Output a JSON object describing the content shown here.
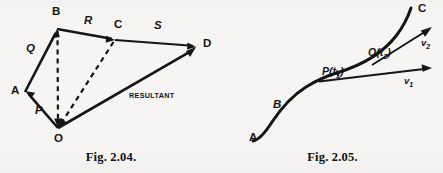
{
  "page": {
    "background_color": "#f6f5f3",
    "ink_color": "#151515",
    "width": 443,
    "height": 173
  },
  "figures": [
    {
      "id": "fig-2-04",
      "caption": "Fig. 2.04.",
      "caption_x": 110,
      "caption_y": 152,
      "description": "Vector polygon addition: vectors P, Q, R, S chained from O to D with resultant O to D",
      "vertices": [
        {
          "label": "O",
          "x": 58,
          "y": 128,
          "label_x": 54,
          "label_y": 136
        },
        {
          "label": "A",
          "x": 25,
          "y": 92,
          "label_x": 11,
          "label_y": 88
        },
        {
          "label": "B",
          "x": 57,
          "y": 29,
          "label_x": 52,
          "label_y": 9
        },
        {
          "label": "C",
          "x": 115,
          "y": 40,
          "label_x": 115,
          "label_y": 22
        },
        {
          "label": "D",
          "x": 196,
          "y": 47,
          "label_x": 203,
          "label_y": 42
        }
      ],
      "vector_labels": [
        {
          "text": "Q",
          "x": 27,
          "y": 47
        },
        {
          "text": "P",
          "x": 36,
          "y": 110
        },
        {
          "text": "R",
          "x": 85,
          "y": 19
        },
        {
          "text": "S",
          "x": 155,
          "y": 24
        }
      ],
      "annotation": {
        "text": "RESULTANT",
        "x": 130,
        "y": 93
      },
      "solid_edges": [
        {
          "from": "O",
          "to": "A",
          "name": "edge-O-A"
        },
        {
          "from": "A",
          "to": "B",
          "name": "edge-A-B-vector-Q"
        },
        {
          "from": "B",
          "to": "C",
          "name": "edge-B-C-vector-R"
        },
        {
          "from": "C",
          "to": "D",
          "name": "edge-C-D-vector-S"
        },
        {
          "from": "O",
          "to": "D",
          "name": "edge-O-D-resultant"
        }
      ],
      "dashed_edges": [
        {
          "from": "B",
          "to": "O",
          "name": "dashed-B-O"
        },
        {
          "from": "C",
          "to": "O",
          "name": "dashed-C-O"
        }
      ]
    },
    {
      "id": "fig-2-05",
      "caption": "Fig. 2.05.",
      "caption_x": 345,
      "caption_y": 152,
      "description": "Curved particle path A-B-P-Q-C with tangent velocity vectors v1 at P and v2 at Q",
      "point_labels": [
        {
          "text": "A",
          "x": 249,
          "y": 136,
          "style": "vertex"
        },
        {
          "text": "B",
          "x": 273,
          "y": 103,
          "style": "vecname"
        },
        {
          "text": "C",
          "x": 418,
          "y": 6,
          "style": "vertex"
        },
        {
          "text": "P(t1)",
          "base": "P(t",
          "sub": "1",
          "tail": ")",
          "x": 322,
          "y": 74,
          "style": "ptlabel"
        },
        {
          "text": "Q(t2)",
          "base": "Q(t",
          "sub": "2",
          "tail": ")",
          "x": 368,
          "y": 55,
          "style": "ptlabel"
        }
      ],
      "velocity_labels": [
        {
          "base": "v",
          "sub": "1",
          "x": 404,
          "y": 80
        },
        {
          "base": "v",
          "sub": "2",
          "x": 421,
          "y": 42
        }
      ]
    }
  ]
}
